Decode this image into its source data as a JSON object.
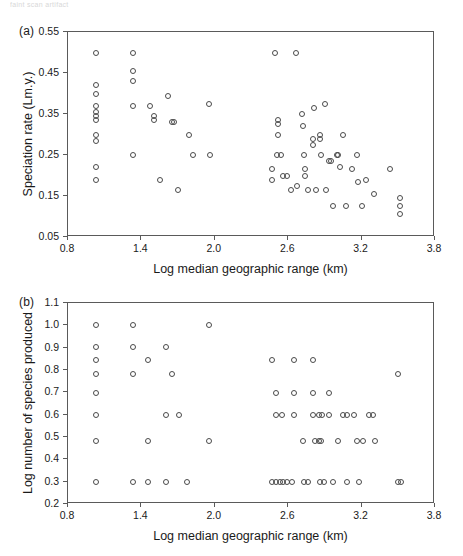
{
  "figure": {
    "artifact_text": "faint scan artifact",
    "background_color": "#ffffff",
    "marker_color": "#4a4a4a",
    "axis_color": "#5a5a5a"
  },
  "panels": [
    {
      "tag": "(a)",
      "chart_data": {
        "type": "scatter",
        "title": "",
        "xlabel": "Log median geographic range (km)",
        "ylabel": "Speciation rate (Lm.y.)",
        "xlim": [
          0.8,
          3.8
        ],
        "ylim": [
          0.05,
          0.55
        ],
        "xticks": [
          "0.8",
          "1.4",
          "2.0",
          "2.6",
          "3.2",
          "3.8"
        ],
        "xtick_values": [
          0.8,
          1.4,
          2.0,
          2.6,
          3.2,
          3.8
        ],
        "yticks": [
          "0.05",
          "0.15",
          "0.25",
          "0.35",
          "0.45",
          "0.55"
        ],
        "ytick_values": [
          0.05,
          0.15,
          0.25,
          0.35,
          0.45,
          0.55
        ],
        "grid": false,
        "legend": "none",
        "points": [
          [
            1.03,
            0.5
          ],
          [
            1.03,
            0.42
          ],
          [
            1.03,
            0.4
          ],
          [
            1.03,
            0.37
          ],
          [
            1.03,
            0.355
          ],
          [
            1.03,
            0.345
          ],
          [
            1.03,
            0.335
          ],
          [
            1.03,
            0.3
          ],
          [
            1.03,
            0.285
          ],
          [
            1.03,
            0.22
          ],
          [
            1.03,
            0.19
          ],
          [
            1.33,
            0.5
          ],
          [
            1.33,
            0.455
          ],
          [
            1.33,
            0.43
          ],
          [
            1.33,
            0.37
          ],
          [
            1.33,
            0.25
          ],
          [
            1.47,
            0.37
          ],
          [
            1.5,
            0.345
          ],
          [
            1.5,
            0.335
          ],
          [
            1.55,
            0.19
          ],
          [
            1.62,
            0.395
          ],
          [
            1.65,
            0.33
          ],
          [
            1.67,
            0.33
          ],
          [
            1.7,
            0.165
          ],
          [
            1.79,
            0.3
          ],
          [
            1.82,
            0.25
          ],
          [
            1.95,
            0.375
          ],
          [
            1.96,
            0.25
          ],
          [
            2.49,
            0.5
          ],
          [
            2.66,
            0.5
          ],
          [
            2.47,
            0.215
          ],
          [
            2.47,
            0.19
          ],
          [
            2.52,
            0.335
          ],
          [
            2.52,
            0.325
          ],
          [
            2.52,
            0.3
          ],
          [
            2.51,
            0.25
          ],
          [
            2.54,
            0.25
          ],
          [
            2.56,
            0.2
          ],
          [
            2.59,
            0.2
          ],
          [
            2.62,
            0.165
          ],
          [
            2.67,
            0.175
          ],
          [
            2.71,
            0.35
          ],
          [
            2.72,
            0.32
          ],
          [
            2.73,
            0.25
          ],
          [
            2.74,
            0.2
          ],
          [
            2.74,
            0.215
          ],
          [
            2.76,
            0.165
          ],
          [
            2.81,
            0.365
          ],
          [
            2.8,
            0.29
          ],
          [
            2.8,
            0.275
          ],
          [
            2.83,
            0.165
          ],
          [
            2.86,
            0.3
          ],
          [
            2.86,
            0.29
          ],
          [
            2.87,
            0.25
          ],
          [
            2.9,
            0.375
          ],
          [
            2.91,
            0.165
          ],
          [
            2.93,
            0.235
          ],
          [
            2.95,
            0.235
          ],
          [
            2.97,
            0.125
          ],
          [
            3.0,
            0.25
          ],
          [
            3.01,
            0.25
          ],
          [
            3.02,
            0.22
          ],
          [
            3.05,
            0.3
          ],
          [
            3.07,
            0.125
          ],
          [
            3.12,
            0.215
          ],
          [
            3.16,
            0.25
          ],
          [
            3.17,
            0.185
          ],
          [
            3.2,
            0.125
          ],
          [
            3.24,
            0.19
          ],
          [
            3.3,
            0.155
          ],
          [
            3.43,
            0.215
          ],
          [
            3.51,
            0.145
          ],
          [
            3.51,
            0.125
          ],
          [
            3.51,
            0.105
          ]
        ]
      }
    },
    {
      "tag": "(b)",
      "chart_data": {
        "type": "scatter",
        "title": "",
        "xlabel": "Log median geographic range (km)",
        "ylabel": "Log number of species produced",
        "xlim": [
          0.8,
          3.8
        ],
        "ylim": [
          0.2,
          1.1
        ],
        "xticks": [
          "0.8",
          "1.4",
          "2.0",
          "2.6",
          "3.2",
          "3.8"
        ],
        "xtick_values": [
          0.8,
          1.4,
          2.0,
          2.6,
          3.2,
          3.8
        ],
        "yticks": [
          "0.2",
          "0.3",
          "0.4",
          "0.5",
          "0.6",
          "0.7",
          "0.8",
          "0.9",
          "1.0",
          "1.1"
        ],
        "ytick_values": [
          0.2,
          0.3,
          0.4,
          0.5,
          0.6,
          0.7,
          0.8,
          0.9,
          1.0,
          1.1
        ],
        "grid": false,
        "legend": "none",
        "points": [
          [
            1.03,
            1.0
          ],
          [
            1.03,
            0.905
          ],
          [
            1.03,
            0.845
          ],
          [
            1.03,
            0.78
          ],
          [
            1.03,
            0.695
          ],
          [
            1.03,
            0.6
          ],
          [
            1.03,
            0.48
          ],
          [
            1.03,
            0.3
          ],
          [
            1.33,
            1.0
          ],
          [
            1.33,
            0.905
          ],
          [
            1.33,
            0.78
          ],
          [
            1.33,
            0.3
          ],
          [
            1.45,
            0.845
          ],
          [
            1.45,
            0.48
          ],
          [
            1.45,
            0.3
          ],
          [
            1.6,
            0.905
          ],
          [
            1.6,
            0.6
          ],
          [
            1.6,
            0.3
          ],
          [
            1.65,
            0.78
          ],
          [
            1.71,
            0.6
          ],
          [
            1.77,
            0.3
          ],
          [
            1.95,
            1.0
          ],
          [
            1.95,
            0.48
          ],
          [
            2.47,
            0.845
          ],
          [
            2.5,
            0.695
          ],
          [
            2.5,
            0.6
          ],
          [
            2.55,
            0.6
          ],
          [
            2.47,
            0.3
          ],
          [
            2.5,
            0.3
          ],
          [
            2.53,
            0.3
          ],
          [
            2.56,
            0.3
          ],
          [
            2.59,
            0.3
          ],
          [
            2.63,
            0.3
          ],
          [
            2.65,
            0.845
          ],
          [
            2.65,
            0.695
          ],
          [
            2.65,
            0.6
          ],
          [
            2.72,
            0.48
          ],
          [
            2.73,
            0.3
          ],
          [
            2.76,
            0.3
          ],
          [
            2.8,
            0.845
          ],
          [
            2.8,
            0.695
          ],
          [
            2.8,
            0.6
          ],
          [
            2.82,
            0.48
          ],
          [
            2.85,
            0.48
          ],
          [
            2.87,
            0.48
          ],
          [
            2.86,
            0.3
          ],
          [
            2.89,
            0.3
          ],
          [
            2.85,
            0.6
          ],
          [
            2.88,
            0.6
          ],
          [
            2.93,
            0.695
          ],
          [
            2.93,
            0.6
          ],
          [
            2.97,
            0.3
          ],
          [
            3.01,
            0.48
          ],
          [
            3.05,
            0.6
          ],
          [
            3.08,
            0.6
          ],
          [
            3.08,
            0.3
          ],
          [
            3.14,
            0.6
          ],
          [
            3.16,
            0.48
          ],
          [
            3.21,
            0.48
          ],
          [
            3.18,
            0.3
          ],
          [
            3.26,
            0.6
          ],
          [
            3.29,
            0.6
          ],
          [
            3.31,
            0.48
          ],
          [
            3.5,
            0.78
          ],
          [
            3.5,
            0.3
          ],
          [
            3.52,
            0.3
          ]
        ]
      }
    }
  ]
}
